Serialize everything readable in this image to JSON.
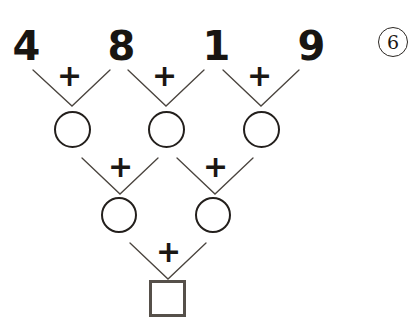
{
  "worksheet": {
    "title": "Addition Pyramid Puzzle",
    "problem_number": "6",
    "ink_color": "#231f1c",
    "line_color": "#4a443e",
    "square_color": "#56504a",
    "operator": "+",
    "rows": [
      {
        "row_name": "top-numbers",
        "shape": "text",
        "cells": [
          {
            "label": "4",
            "filled": true
          },
          {
            "label": "8",
            "filled": true
          },
          {
            "label": "1",
            "filled": true
          },
          {
            "label": "9",
            "filled": true
          }
        ],
        "operators": [
          "+",
          "+",
          "+"
        ]
      },
      {
        "row_name": "second-row-circles",
        "shape": "circle",
        "cells": [
          {
            "label": "",
            "filled": false
          },
          {
            "label": "",
            "filled": false
          },
          {
            "label": "",
            "filled": false
          }
        ],
        "operators": [
          "+",
          "+"
        ]
      },
      {
        "row_name": "third-row-circles",
        "shape": "circle",
        "cells": [
          {
            "label": "",
            "filled": false
          },
          {
            "label": "",
            "filled": false
          }
        ],
        "operators": [
          "+"
        ]
      },
      {
        "row_name": "answer-row-square",
        "shape": "square",
        "cells": [
          {
            "label": "",
            "filled": false
          }
        ],
        "operators": []
      }
    ]
  }
}
